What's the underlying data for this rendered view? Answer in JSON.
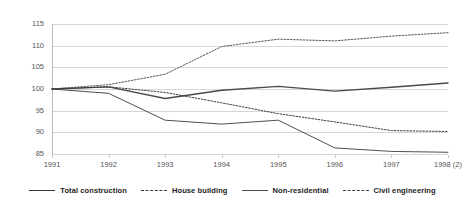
{
  "chart_data": {
    "type": "line",
    "title": "",
    "xlabel": "",
    "ylabel": "",
    "ylim": [
      85,
      115
    ],
    "yticks": [
      85,
      90,
      95,
      100,
      105,
      110,
      115
    ],
    "grid": true,
    "legend_position": "bottom",
    "categories": [
      "1991",
      "1992",
      "1993",
      "1994",
      "1995",
      "1996",
      "1997",
      "1998 (2)"
    ],
    "series": [
      {
        "name": "Total construction",
        "style": "solid-thin",
        "color": "#3a3a3a",
        "values": [
          100,
          99,
          92.8,
          91.9,
          92.8,
          86.4,
          85.6,
          85.4
        ]
      },
      {
        "name": "House building",
        "style": "dashed",
        "color": "#555555",
        "values": [
          100,
          101,
          103.4,
          109.8,
          111.5,
          111.1,
          112.2,
          113
        ]
      },
      {
        "name": "Non-residential",
        "style": "solid-thick",
        "color": "#4a4a4a",
        "values": [
          100,
          100.5,
          97.8,
          99.7,
          100.6,
          99.5,
          100.4,
          101.4
        ]
      },
      {
        "name": "Civil engineering",
        "style": "dashed",
        "color": "#3a3a3a",
        "values": [
          100,
          100.5,
          99.2,
          96.8,
          94.3,
          92.4,
          90.4,
          90.2
        ]
      }
    ]
  },
  "yaxis": {
    "labels": [
      "115",
      "110",
      "105",
      "100",
      "95",
      "90",
      "85"
    ]
  },
  "xaxis": {
    "labels": [
      "1991",
      "1992",
      "1993",
      "1994",
      "1995",
      "1996",
      "1997",
      "1998 (2)"
    ]
  },
  "legend": {
    "items": [
      {
        "label": "Total construction",
        "style": "solid-thin"
      },
      {
        "label": "House building",
        "style": "dashed"
      },
      {
        "label": "Non-residential",
        "style": "solid-thick"
      },
      {
        "label": "Civil engineering",
        "style": "dashed"
      }
    ]
  }
}
